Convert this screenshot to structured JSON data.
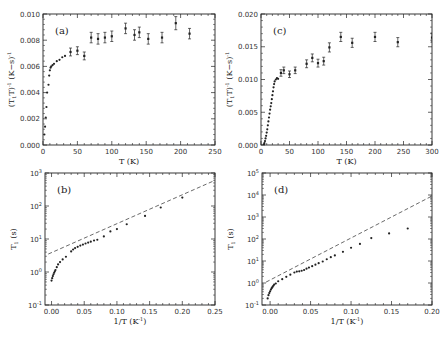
{
  "chart_data": [
    {
      "panel": "(a)",
      "type": "scatter",
      "xlabel": "T (K)",
      "ylabel": "(T1T)^-1 (K-s)^-1",
      "xlim": [
        0,
        250
      ],
      "ylim": [
        0.0,
        0.01
      ],
      "xticks": [
        "0",
        "50",
        "100",
        "150",
        "200",
        "250"
      ],
      "yticks": [
        "0.000",
        "0.002",
        "0.004",
        "0.006",
        "0.008",
        "0.010"
      ],
      "yscale": "linear",
      "frame": {
        "x": 43,
        "y": 14,
        "w": 172,
        "h": 131
      },
      "points": [
        {
          "x": 2,
          "y": 0.0008
        },
        {
          "x": 3,
          "y": 0.0014
        },
        {
          "x": 4,
          "y": 0.0021
        },
        {
          "x": 5,
          "y": 0.0029
        },
        {
          "x": 6,
          "y": 0.004
        },
        {
          "x": 8,
          "y": 0.0046
        },
        {
          "x": 9,
          "y": 0.0053
        },
        {
          "x": 10,
          "y": 0.0057
        },
        {
          "x": 11,
          "y": 0.0059
        },
        {
          "x": 12,
          "y": 0.006
        },
        {
          "x": 14,
          "y": 0.0061
        },
        {
          "x": 16,
          "y": 0.0062
        },
        {
          "x": 20,
          "y": 0.0064
        },
        {
          "x": 24,
          "y": 0.0065
        },
        {
          "x": 28,
          "y": 0.0067
        },
        {
          "x": 32,
          "y": 0.0068
        }
      ],
      "errorbars": [
        {
          "x": 40,
          "y": 0.0071,
          "e": 0.0003
        },
        {
          "x": 50,
          "y": 0.0072,
          "e": 0.0003
        },
        {
          "x": 60,
          "y": 0.0068,
          "e": 0.0003
        },
        {
          "x": 70,
          "y": 0.0082,
          "e": 0.0004
        },
        {
          "x": 80,
          "y": 0.0081,
          "e": 0.0004
        },
        {
          "x": 90,
          "y": 0.0082,
          "e": 0.0004
        },
        {
          "x": 100,
          "y": 0.0083,
          "e": 0.0004
        },
        {
          "x": 120,
          "y": 0.0089,
          "e": 0.0004
        },
        {
          "x": 133,
          "y": 0.0084,
          "e": 0.0004
        },
        {
          "x": 140,
          "y": 0.0086,
          "e": 0.0004
        },
        {
          "x": 153,
          "y": 0.0081,
          "e": 0.0004
        },
        {
          "x": 173,
          "y": 0.0082,
          "e": 0.0004
        },
        {
          "x": 193,
          "y": 0.0093,
          "e": 0.0005
        },
        {
          "x": 213,
          "y": 0.0085,
          "e": 0.0004
        }
      ]
    },
    {
      "panel": "(c)",
      "type": "scatter",
      "xlabel": "T (K)",
      "ylabel": "(T1T)^-1 (K-s)^-1",
      "xlim": [
        0,
        300
      ],
      "ylim": [
        0.0,
        0.02
      ],
      "xticks": [
        "0",
        "50",
        "100",
        "150",
        "200",
        "250",
        "300"
      ],
      "yticks": [
        "0.000",
        "0.005",
        "0.010",
        "0.015",
        "0.020"
      ],
      "yscale": "linear",
      "frame": {
        "x": 261,
        "y": 14,
        "w": 171,
        "h": 131
      },
      "points": [
        {
          "x": 5,
          "y": 0.0001
        },
        {
          "x": 6,
          "y": 0.0003
        },
        {
          "x": 7,
          "y": 0.0006
        },
        {
          "x": 8,
          "y": 0.001
        },
        {
          "x": 9,
          "y": 0.0014
        },
        {
          "x": 10,
          "y": 0.0019
        },
        {
          "x": 11,
          "y": 0.0024
        },
        {
          "x": 12,
          "y": 0.003
        },
        {
          "x": 13,
          "y": 0.0036
        },
        {
          "x": 14,
          "y": 0.0042
        },
        {
          "x": 15,
          "y": 0.0048
        },
        {
          "x": 16,
          "y": 0.0054
        },
        {
          "x": 17,
          "y": 0.0059
        },
        {
          "x": 18,
          "y": 0.0064
        },
        {
          "x": 19,
          "y": 0.007
        },
        {
          "x": 20,
          "y": 0.0076
        },
        {
          "x": 21,
          "y": 0.0082
        },
        {
          "x": 22,
          "y": 0.0088
        },
        {
          "x": 23,
          "y": 0.0093
        },
        {
          "x": 24,
          "y": 0.0097
        },
        {
          "x": 26,
          "y": 0.01
        },
        {
          "x": 28,
          "y": 0.0102
        },
        {
          "x": 30,
          "y": 0.0101
        }
      ],
      "errorbars": [
        {
          "x": 35,
          "y": 0.011,
          "e": 0.0005
        },
        {
          "x": 40,
          "y": 0.0114,
          "e": 0.0005
        },
        {
          "x": 50,
          "y": 0.0108,
          "e": 0.0005
        },
        {
          "x": 60,
          "y": 0.0114,
          "e": 0.0005
        },
        {
          "x": 80,
          "y": 0.0124,
          "e": 0.0006
        },
        {
          "x": 90,
          "y": 0.0133,
          "e": 0.0006
        },
        {
          "x": 100,
          "y": 0.0125,
          "e": 0.0006
        },
        {
          "x": 110,
          "y": 0.0128,
          "e": 0.0006
        },
        {
          "x": 120,
          "y": 0.0149,
          "e": 0.0007
        },
        {
          "x": 140,
          "y": 0.0165,
          "e": 0.0007
        },
        {
          "x": 160,
          "y": 0.0156,
          "e": 0.0007
        },
        {
          "x": 200,
          "y": 0.0165,
          "e": 0.0007
        },
        {
          "x": 240,
          "y": 0.0157,
          "e": 0.0007
        },
        {
          "x": 300,
          "y": 0.0164,
          "e": 0.0007
        }
      ]
    },
    {
      "panel": "(b)",
      "type": "scatter",
      "xlabel": "1/T (K^-1)",
      "ylabel": "T1 (s)",
      "xlim": [
        -0.01,
        0.25
      ],
      "ylim": [
        0.1,
        1000
      ],
      "xticks": [
        "0.00",
        "0.05",
        "0.10",
        "0.15",
        "0.20",
        "0.25"
      ],
      "yticks": [
        "10^-1",
        "10^0",
        "10^1",
        "10^2",
        "10^3"
      ],
      "yscale": "log",
      "frame": {
        "x": 45,
        "y": 173,
        "w": 170,
        "h": 132
      },
      "fit_line": {
        "style": "dashed",
        "from": {
          "x": -0.005,
          "y": 3.5
        },
        "to": {
          "x": 0.25,
          "y": 600
        }
      },
      "points": [
        {
          "x": 0.0,
          "y": 0.55
        },
        {
          "x": 0.001,
          "y": 0.65
        },
        {
          "x": 0.002,
          "y": 0.75
        },
        {
          "x": 0.003,
          "y": 0.85
        },
        {
          "x": 0.004,
          "y": 0.95
        },
        {
          "x": 0.005,
          "y": 1.05
        },
        {
          "x": 0.006,
          "y": 1.15
        },
        {
          "x": 0.008,
          "y": 1.4
        },
        {
          "x": 0.01,
          "y": 1.7
        },
        {
          "x": 0.013,
          "y": 2.0
        },
        {
          "x": 0.017,
          "y": 2.4
        },
        {
          "x": 0.022,
          "y": 2.9
        },
        {
          "x": 0.03,
          "y": 4.2
        },
        {
          "x": 0.033,
          "y": 4.8
        },
        {
          "x": 0.036,
          "y": 5.3
        },
        {
          "x": 0.04,
          "y": 5.8
        },
        {
          "x": 0.044,
          "y": 6.3
        },
        {
          "x": 0.048,
          "y": 6.8
        },
        {
          "x": 0.052,
          "y": 7.3
        },
        {
          "x": 0.056,
          "y": 7.8
        },
        {
          "x": 0.06,
          "y": 8.3
        },
        {
          "x": 0.065,
          "y": 9.0
        },
        {
          "x": 0.07,
          "y": 9.5
        },
        {
          "x": 0.08,
          "y": 12
        },
        {
          "x": 0.09,
          "y": 17
        },
        {
          "x": 0.1,
          "y": 20
        },
        {
          "x": 0.115,
          "y": 28
        },
        {
          "x": 0.143,
          "y": 50
        },
        {
          "x": 0.167,
          "y": 90
        },
        {
          "x": 0.2,
          "y": 180
        }
      ]
    },
    {
      "panel": "(d)",
      "type": "scatter",
      "xlabel": "1/T (K^-1)",
      "ylabel": "T1 (s)",
      "xlim": [
        -0.01,
        0.2
      ],
      "ylim": [
        0.1,
        100000
      ],
      "xticks": [
        "0.00",
        "0.05",
        "0.10",
        "0.15",
        "0.20"
      ],
      "yticks": [
        "10^-1",
        "10^0",
        "10^1",
        "10^2",
        "10^3",
        "10^4",
        "10^5"
      ],
      "yscale": "log",
      "frame": {
        "x": 262,
        "y": 173,
        "w": 170,
        "h": 132
      },
      "fit_line": {
        "style": "dashed",
        "from": {
          "x": -0.005,
          "y": 1.1
        },
        "to": {
          "x": 0.2,
          "y": 9000
        }
      },
      "points": [
        {
          "x": -0.003,
          "y": 0.2
        },
        {
          "x": -0.002,
          "y": 0.28
        },
        {
          "x": -0.001,
          "y": 0.35
        },
        {
          "x": 0.0,
          "y": 0.42
        },
        {
          "x": 0.001,
          "y": 0.5
        },
        {
          "x": 0.002,
          "y": 0.58
        },
        {
          "x": 0.003,
          "y": 0.66
        },
        {
          "x": 0.004,
          "y": 0.75
        },
        {
          "x": 0.005,
          "y": 0.85
        },
        {
          "x": 0.007,
          "y": 0.95
        },
        {
          "x": 0.01,
          "y": 1.2
        },
        {
          "x": 0.015,
          "y": 1.5
        },
        {
          "x": 0.02,
          "y": 1.9
        },
        {
          "x": 0.025,
          "y": 2.4
        },
        {
          "x": 0.03,
          "y": 3.0
        },
        {
          "x": 0.033,
          "y": 3.3
        },
        {
          "x": 0.036,
          "y": 3.4
        },
        {
          "x": 0.039,
          "y": 3.6
        },
        {
          "x": 0.042,
          "y": 3.9
        },
        {
          "x": 0.045,
          "y": 4.5
        },
        {
          "x": 0.048,
          "y": 5.0
        },
        {
          "x": 0.052,
          "y": 5.8
        },
        {
          "x": 0.056,
          "y": 6.8
        },
        {
          "x": 0.06,
          "y": 8.0
        },
        {
          "x": 0.065,
          "y": 9.5
        },
        {
          "x": 0.07,
          "y": 12
        },
        {
          "x": 0.075,
          "y": 15
        },
        {
          "x": 0.08,
          "y": 18
        },
        {
          "x": 0.09,
          "y": 26
        },
        {
          "x": 0.1,
          "y": 40
        },
        {
          "x": 0.111,
          "y": 60
        },
        {
          "x": 0.125,
          "y": 110
        },
        {
          "x": 0.147,
          "y": 180
        },
        {
          "x": 0.17,
          "y": 300
        }
      ]
    }
  ]
}
